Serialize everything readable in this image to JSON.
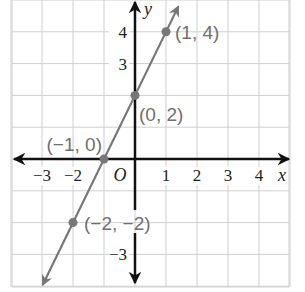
{
  "chart_data": {
    "type": "line",
    "title": "",
    "xlabel": "x",
    "ylabel": "y",
    "origin_label": "O",
    "xlim": [
      -4.1,
      5
    ],
    "ylim": [
      -4.1,
      5
    ],
    "grid": true,
    "x_ticks": [
      {
        "v": -3,
        "label": "−3"
      },
      {
        "v": -2,
        "label": "−2"
      },
      {
        "v": 1,
        "label": "1"
      },
      {
        "v": 2,
        "label": "2"
      },
      {
        "v": 3,
        "label": "3"
      },
      {
        "v": 4,
        "label": "4"
      }
    ],
    "y_ticks": [
      {
        "v": 4,
        "label": "4"
      },
      {
        "v": 3,
        "label": "3"
      },
      {
        "v": -3,
        "label": "−3"
      }
    ],
    "series": [
      {
        "name": "y = 2x + 2",
        "color": "#777777",
        "points": [
          {
            "x": 1,
            "y": 4,
            "label": "(1, 4)"
          },
          {
            "x": 0,
            "y": 2,
            "label": "(0, 2)"
          },
          {
            "x": -1,
            "y": 0,
            "label": "(−1, 0)"
          },
          {
            "x": -2,
            "y": -2,
            "label": "(−2, −2)"
          }
        ]
      }
    ]
  },
  "colors": {
    "grid": "#cfcfcf",
    "axis": "#111111",
    "line": "#777777",
    "label": "#6f6f6f"
  }
}
